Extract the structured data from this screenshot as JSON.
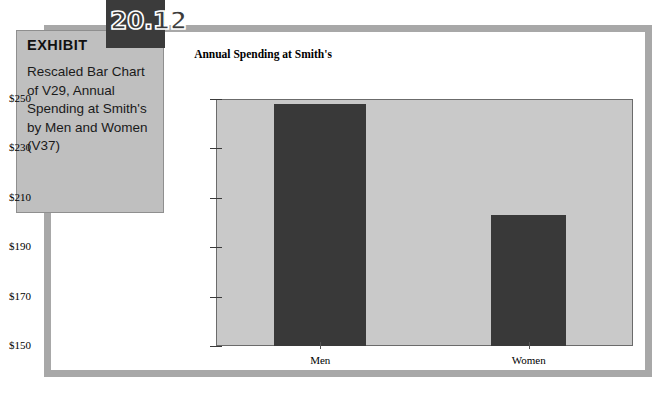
{
  "exhibit": {
    "number": "20.12",
    "label": "EXHIBIT",
    "description": "Rescaled Bar Chart of V29, Annual Spending at Smith's by Men and Women (V37)"
  },
  "colors": {
    "frame": "#a8a8a8",
    "exhibit_box": "#bfbfbf",
    "number_tab": "#3b3b3b",
    "plot_background": "#c9c9c9",
    "bar": "#393939"
  },
  "chart_data": {
    "type": "bar",
    "title": "Annual Spending at Smith's",
    "xlabel": "",
    "ylabel": "",
    "categories": [
      "Men",
      "Women"
    ],
    "values": [
      248,
      203
    ],
    "ylim": [
      150,
      250
    ],
    "yticks": [
      250,
      230,
      210,
      190,
      170,
      150
    ],
    "ytick_labels": [
      "$250",
      "$230",
      "$210",
      "$190",
      "$170",
      "$150"
    ],
    "grid": false,
    "legend": null,
    "note": "Y axis rescaled to start at $150 rather than $0"
  }
}
